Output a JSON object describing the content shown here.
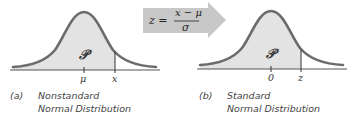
{
  "panel_a": {
    "tag": "(a)",
    "caption_line1": "Nonstandard",
    "caption_line2": "Normal Distribution",
    "region_label": "𝒫",
    "center_label": "μ",
    "bound_label": "x"
  },
  "panel_b": {
    "tag": "(b)",
    "caption_line1": "Standard",
    "caption_line2": "Normal Distribution",
    "region_label": "𝒫",
    "center_label": "0",
    "bound_label": "z"
  },
  "transform": {
    "lhs": "z =",
    "numerator": "x − μ",
    "denominator": "σ"
  },
  "colors": {
    "curve": "#6b6b6b",
    "fill": "#e3e3e3",
    "arrow": "#c8c8c8",
    "axis": "#555555"
  }
}
